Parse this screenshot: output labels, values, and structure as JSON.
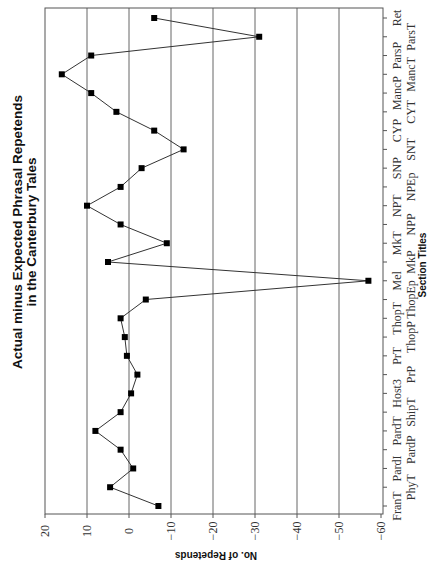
{
  "chart_data": {
    "type": "line",
    "orientation": "rotated-90-ccw",
    "title": "Actual minus Expected Phrasal Repetends in the Canterbury Tales",
    "title_lines": [
      "Actual minus Expected Phrasal Repetends",
      "in the Canterbury Tales"
    ],
    "xlabel": "Section Titles",
    "ylabel": "No. of Repetends",
    "ylim": [
      -60,
      20
    ],
    "yticks": [
      20,
      10,
      0,
      -10,
      -20,
      -30,
      -40,
      -50,
      -60
    ],
    "grid": true,
    "legend": null,
    "categories": [
      "FranT",
      "PhyT",
      "PardI",
      "PardP",
      "PardT",
      "ShipT",
      "Host3",
      "PrP",
      "PrT",
      "ThopP",
      "ThopT",
      "ThopEp",
      "Mel",
      "MkP",
      "MkT",
      "NPP",
      "NPT",
      "NPEp",
      "SNP",
      "SNT",
      "CYP",
      "CYT",
      "MancP",
      "MancT",
      "ParsP",
      "ParsT",
      "Ret"
    ],
    "series": [
      {
        "name": "Actual minus Expected",
        "marker": "square",
        "color": "#000000",
        "values": [
          -7,
          4.5,
          -1,
          2,
          8,
          2,
          -0.5,
          -2,
          0.5,
          1,
          2,
          -4,
          -57,
          5,
          -9,
          2,
          10,
          2,
          -3,
          -13,
          -6,
          3,
          9,
          16,
          9,
          -31,
          -6
        ]
      }
    ]
  }
}
